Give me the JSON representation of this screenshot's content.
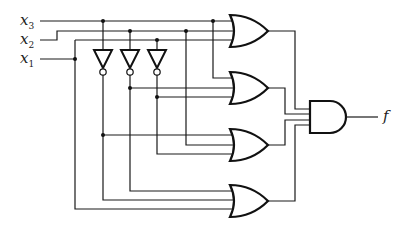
{
  "diagram": {
    "type": "logic-circuit",
    "inputs": [
      {
        "name": "x",
        "sub": "3"
      },
      {
        "name": "x",
        "sub": "2"
      },
      {
        "name": "x",
        "sub": "1"
      }
    ],
    "output": {
      "name": "f"
    },
    "gates": [
      {
        "id": "inv1",
        "type": "NOT",
        "input": "x3"
      },
      {
        "id": "inv2",
        "type": "NOT",
        "input": "x2"
      },
      {
        "id": "inv3",
        "type": "NOT",
        "input": "x1"
      },
      {
        "id": "or1",
        "type": "OR",
        "inputs": [
          "x3",
          "x2",
          "x1"
        ]
      },
      {
        "id": "or2",
        "type": "OR",
        "inputs": [
          "x3",
          "x2'",
          "x1'"
        ]
      },
      {
        "id": "or3",
        "type": "OR",
        "inputs": [
          "x3'",
          "x2",
          "x1'"
        ]
      },
      {
        "id": "or4",
        "type": "OR",
        "inputs": [
          "x2'",
          "x3'",
          "x1"
        ]
      },
      {
        "id": "and1",
        "type": "AND",
        "inputs": [
          "or1",
          "or2",
          "or3",
          "or4"
        ],
        "output": "f"
      }
    ]
  }
}
